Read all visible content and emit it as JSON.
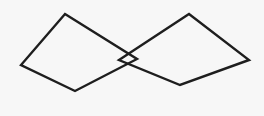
{
  "diagram": {
    "width": 264,
    "height": 116,
    "background": "#f7f7f7",
    "stroke_color": "#1e1e1e",
    "stroke_width": 2.4,
    "shapes": [
      {
        "name": "left-quadrilateral",
        "type": "polygon",
        "points": [
          [
            65,
            14
          ],
          [
            137,
            59
          ],
          [
            75,
            91
          ],
          [
            21,
            65
          ]
        ]
      },
      {
        "name": "right-quadrilateral",
        "type": "polygon",
        "points": [
          [
            119,
            60
          ],
          [
            189,
            14
          ],
          [
            249,
            60
          ],
          [
            180,
            85
          ]
        ]
      }
    ],
    "intersection": [
      128,
      53
    ]
  }
}
